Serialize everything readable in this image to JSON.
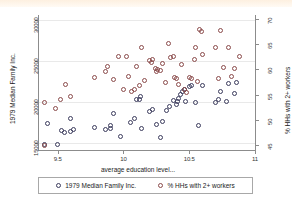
{
  "chart_data": {
    "type": "scatter",
    "title": "",
    "xlabel": "average education level...",
    "ylabel_left": "1979 Median Family Inc.",
    "ylabel_right": "% HHs with 2+ workers",
    "xlim": [
      9.35,
      11.0
    ],
    "xticks": [
      "9.5",
      "10",
      "10.5",
      "11"
    ],
    "xtick_values": [
      9.5,
      10,
      10.5,
      11
    ],
    "ylim_left": [
      14200,
      30600
    ],
    "yticks_left": [
      "15000",
      "20000",
      "25000",
      "30000"
    ],
    "ytick_values_left": [
      15000,
      20000,
      25000,
      30000
    ],
    "ylim_right": [
      44.0,
      70.8
    ],
    "yticks_right": [
      "45",
      "50",
      "55",
      "60",
      "65",
      "70"
    ],
    "ytick_values_right": [
      45,
      50,
      55,
      60,
      65,
      70
    ],
    "grid": true,
    "legend_position": "below",
    "series": [
      {
        "name": "1979 Median Family Inc.",
        "axis": "left",
        "color": "#3b3b5c",
        "marker": "open-circle",
        "points": [
          [
            9.4,
            14900
          ],
          [
            9.5,
            14850
          ],
          [
            9.42,
            17450
          ],
          [
            9.53,
            16600
          ],
          [
            9.55,
            16300
          ],
          [
            9.6,
            16400
          ],
          [
            9.62,
            16750
          ],
          [
            9.6,
            18050
          ],
          [
            9.78,
            16900
          ],
          [
            9.86,
            16700
          ],
          [
            9.9,
            17150
          ],
          [
            9.9,
            16800
          ],
          [
            9.92,
            18700
          ],
          [
            9.98,
            15900
          ],
          [
            10.05,
            17600
          ],
          [
            10.08,
            18050
          ],
          [
            10.1,
            20400
          ],
          [
            10.12,
            20300
          ],
          [
            10.13,
            20700
          ],
          [
            10.14,
            16850
          ],
          [
            10.2,
            18850
          ],
          [
            10.22,
            19150
          ],
          [
            10.25,
            17250
          ],
          [
            10.28,
            15750
          ],
          [
            10.3,
            17650
          ],
          [
            10.33,
            19050
          ],
          [
            10.35,
            19450
          ],
          [
            10.38,
            20250
          ],
          [
            10.4,
            19700
          ],
          [
            10.41,
            20150
          ],
          [
            10.42,
            20500
          ],
          [
            10.43,
            20900
          ],
          [
            10.45,
            21350
          ],
          [
            10.46,
            21600
          ],
          [
            10.47,
            20050
          ],
          [
            10.5,
            21900
          ],
          [
            10.52,
            22000
          ],
          [
            10.55,
            20000
          ],
          [
            10.57,
            17200
          ],
          [
            10.6,
            22100
          ],
          [
            10.7,
            20000
          ],
          [
            10.72,
            20300
          ],
          [
            10.74,
            21300
          ],
          [
            10.78,
            20100
          ],
          [
            10.8,
            22300
          ],
          [
            10.84,
            21100
          ],
          [
            10.86,
            22350
          ]
        ]
      },
      {
        "name": "% HHs with 2+ workers",
        "axis": "right",
        "color": "#8a4a4a",
        "marker": "open-circle",
        "points": [
          [
            9.4,
            45.0
          ],
          [
            9.4,
            53.5
          ],
          [
            9.48,
            52.2
          ],
          [
            9.52,
            54.0
          ],
          [
            9.56,
            57.0
          ],
          [
            9.6,
            54.6
          ],
          [
            9.78,
            58.4
          ],
          [
            9.86,
            59.6
          ],
          [
            9.88,
            60.6
          ],
          [
            9.92,
            58.1
          ],
          [
            9.96,
            62.6
          ],
          [
            10.0,
            56.0
          ],
          [
            10.02,
            62.6
          ],
          [
            10.04,
            58.7
          ],
          [
            10.06,
            55.7
          ],
          [
            10.08,
            56.1
          ],
          [
            10.1,
            60.5
          ],
          [
            10.12,
            56.8
          ],
          [
            10.14,
            64.4
          ],
          [
            10.16,
            57.8
          ],
          [
            10.2,
            61.8
          ],
          [
            10.21,
            61.4
          ],
          [
            10.22,
            62.0
          ],
          [
            10.24,
            60.2
          ],
          [
            10.25,
            59.5
          ],
          [
            10.26,
            60.0
          ],
          [
            10.28,
            59.7
          ],
          [
            10.3,
            61.2
          ],
          [
            10.32,
            57.5
          ],
          [
            10.34,
            65.1
          ],
          [
            10.36,
            62.3
          ],
          [
            10.38,
            62.5
          ],
          [
            10.39,
            58.5
          ],
          [
            10.4,
            58.2
          ],
          [
            10.42,
            57.0
          ],
          [
            10.44,
            61.0
          ],
          [
            10.46,
            56.0
          ],
          [
            10.48,
            55.4
          ],
          [
            10.5,
            58.5
          ],
          [
            10.52,
            58.3
          ],
          [
            10.54,
            61.9
          ],
          [
            10.55,
            64.3
          ],
          [
            10.56,
            57.7
          ],
          [
            10.58,
            68.0
          ],
          [
            10.59,
            67.5
          ],
          [
            10.6,
            63.0
          ],
          [
            10.7,
            64.4
          ],
          [
            10.72,
            58.3
          ],
          [
            10.74,
            67.8
          ],
          [
            10.76,
            60.3
          ],
          [
            10.8,
            64.3
          ],
          [
            10.82,
            58.6
          ],
          [
            10.84,
            60.1
          ],
          [
            10.88,
            62.5
          ]
        ]
      }
    ],
    "legend": [
      {
        "label": "1979 Median Family Inc.",
        "color": "#3b3b5c"
      },
      {
        "label": "% HHs with 2+ workers",
        "color": "#8a4a4a"
      }
    ]
  }
}
